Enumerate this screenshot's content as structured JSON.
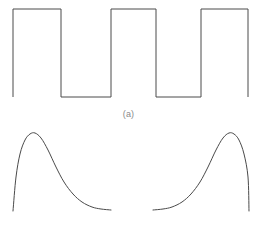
{
  "figure": {
    "background_color": "#ffffff",
    "stroke_color": "#4a4a4a",
    "caption_color": "#8a8a8a",
    "width": 257,
    "height": 241,
    "panels": [
      {
        "id": "a",
        "caption": "(a)",
        "waveform_name": "square-wave",
        "description": "periodic rectangular pulse train",
        "stroke_width": 1
      },
      {
        "id": "b",
        "caption": "(b)",
        "waveform_name": "differentiated-pulse-wave",
        "description": "exponential rise and decay spikes corresponding to pulse edges",
        "stroke_width": 1
      }
    ]
  },
  "chart_data": [
    {
      "type": "line",
      "name": "square-wave",
      "title": "",
      "subtitle": "",
      "xlabel": "",
      "ylabel": "",
      "annotations": [
        "(a)"
      ],
      "xlim": [
        0,
        257
      ],
      "ylim": [
        0,
        110
      ],
      "grid": false,
      "legend": "none",
      "high_level": 9,
      "low_level": 97,
      "series": [
        {
          "name": "pulse-train",
          "points": [
            [
              13,
              97
            ],
            [
              13,
              9
            ],
            [
              61,
              9
            ],
            [
              61,
              97
            ],
            [
              111,
              97
            ],
            [
              111,
              9
            ],
            [
              156,
              9
            ],
            [
              156,
              97
            ],
            [
              201,
              97
            ],
            [
              201,
              9
            ],
            [
              248,
              9
            ],
            [
              248,
              97
            ]
          ]
        }
      ]
    },
    {
      "type": "line",
      "name": "differentiated-pulse-wave",
      "title": "",
      "subtitle": "",
      "xlabel": "",
      "ylabel": "",
      "annotations": [
        "(b)"
      ],
      "xlim": [
        0,
        257
      ],
      "ylim": [
        125,
        215
      ],
      "grid": false,
      "legend": "none",
      "baseline": 211,
      "peak_level": 134,
      "series": [
        {
          "name": "left-spike",
          "points": [
            [
              13,
              212
            ],
            [
              16,
              178
            ],
            [
              20,
              155
            ],
            [
              25,
              141
            ],
            [
              30,
              135
            ],
            [
              35,
              134
            ],
            [
              41,
              139
            ],
            [
              48,
              151
            ],
            [
              56,
              168
            ],
            [
              64,
              183
            ],
            [
              73,
              195
            ],
            [
              82,
              203
            ],
            [
              92,
              208
            ],
            [
              101,
              210
            ],
            [
              111,
              211
            ]
          ]
        },
        {
          "name": "right-spike",
          "points": [
            [
              153,
              211
            ],
            [
              163,
              210
            ],
            [
              172,
              208
            ],
            [
              182,
              203
            ],
            [
              191,
              195
            ],
            [
              200,
              183
            ],
            [
              208,
              168
            ],
            [
              216,
              151
            ],
            [
              223,
              139
            ],
            [
              229,
              134
            ],
            [
              234,
              135
            ],
            [
              239,
              141
            ],
            [
              244,
              155
            ],
            [
              248,
              178
            ],
            [
              249,
              212
            ]
          ]
        }
      ]
    }
  ]
}
